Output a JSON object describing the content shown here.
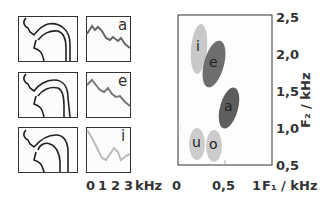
{
  "vowels": [
    {
      "label": "a",
      "row": 0
    },
    {
      "label": "e",
      "row": 1
    },
    {
      "label": "i",
      "row": 2
    }
  ],
  "spectrum_axis": {
    "ticks": [
      "0",
      "1",
      "2",
      "3"
    ],
    "unit": "kHz"
  },
  "formant_chart": {
    "x_ticks": [
      "0",
      "0,5",
      "1"
    ],
    "x_label": "F₁ / kHz",
    "y_ticks": [
      "2,5",
      "2,0",
      "1,5",
      "1,0",
      "0,5"
    ],
    "y_label": "F₂ / kHz",
    "xlim": [
      0,
      1
    ],
    "ylim": [
      0.5,
      2.5
    ],
    "regions": [
      {
        "vowel": "i",
        "f1": 0.32,
        "f2": 2.0,
        "shade": "light",
        "color": "#c8c8c8"
      },
      {
        "vowel": "e",
        "f1": 0.43,
        "f2": 1.8,
        "shade": "dark",
        "color": "#6e6e6e"
      },
      {
        "vowel": "a",
        "f1": 0.7,
        "f2": 1.25,
        "shade": "dark",
        "color": "#5e5e5e"
      },
      {
        "vowel": "u",
        "f1": 0.3,
        "f2": 0.87,
        "shade": "light",
        "color": "#cccccc"
      },
      {
        "vowel": "o",
        "f1": 0.5,
        "f2": 0.87,
        "shade": "light",
        "color": "#cccccc"
      }
    ]
  }
}
